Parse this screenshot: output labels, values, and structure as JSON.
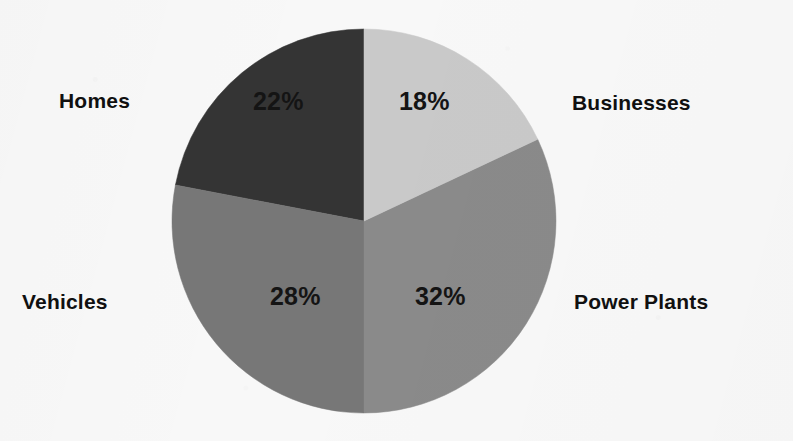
{
  "chart_data": {
    "type": "pie",
    "title": "",
    "subtitle": "",
    "xlabel": "",
    "ylabel": "",
    "legend_position": "outside-labels",
    "grid": false,
    "categories": [
      "Businesses",
      "Power Plants",
      "Vehicles",
      "Homes"
    ],
    "values": [
      18,
      32,
      28,
      22
    ],
    "value_unit": "%",
    "slices": [
      {
        "label": "Businesses",
        "value": 18,
        "value_text": "18%",
        "color": "#c9c9c9",
        "start_angle_deg": 0,
        "end_angle_deg": 64.8
      },
      {
        "label": "Power Plants",
        "value": 32,
        "value_text": "32%",
        "color": "#8a8a8a",
        "start_angle_deg": 64.8,
        "end_angle_deg": 180
      },
      {
        "label": "Vehicles",
        "value": 28,
        "value_text": "28%",
        "color": "#777777",
        "start_angle_deg": 180,
        "end_angle_deg": 280.8
      },
      {
        "label": "Homes",
        "value": 22,
        "value_text": "22%",
        "color": "#343434",
        "start_angle_deg": 280.8,
        "end_angle_deg": 360
      }
    ],
    "background_color": "#f8f8f8",
    "label_text_color": "#101010"
  },
  "geometry": {
    "center_x": 364,
    "center_y": 221,
    "radius": 192
  }
}
